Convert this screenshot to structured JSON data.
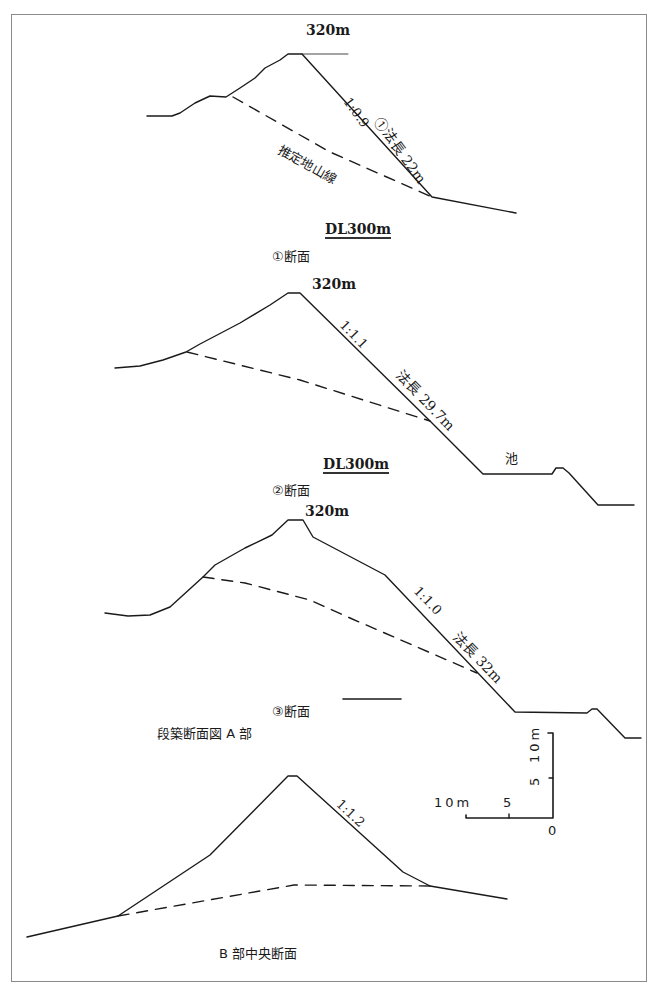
{
  "figure": {
    "group_caption_a": "段築断面図 A 部",
    "caption_b": "B 部中央断面"
  },
  "sections": [
    {
      "id": "section-1",
      "crest_label": "320m",
      "slope_ratio": "1:0.9",
      "slope_length": "①法長 22m",
      "ground_line_label": "推定地山線",
      "datum_label": "DL300m",
      "caption": "①断面"
    },
    {
      "id": "section-2",
      "crest_label": "320m",
      "slope_ratio": "1:1.1",
      "slope_length": "法長 29.7m",
      "pond_label": "池",
      "datum_label": "DL300m",
      "caption": "②断面"
    },
    {
      "id": "section-3",
      "crest_label": "320m",
      "slope_ratio": "1:1.0",
      "slope_length": "法長 32m",
      "caption": "③断面"
    },
    {
      "id": "section-b",
      "slope_ratio": "1:1.2"
    }
  ],
  "scale_bar": {
    "horizontal_labels": [
      "10m",
      "5",
      "0"
    ],
    "vertical_labels": [
      "5",
      "10m"
    ]
  },
  "colors": {
    "line": "#1a1a1a",
    "frame": "#8a8a8a",
    "background": "#ffffff"
  }
}
